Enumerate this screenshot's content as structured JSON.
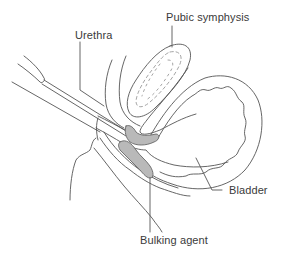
{
  "diagram": {
    "type": "anatomical-cross-section",
    "colors": {
      "line": "#555555",
      "dashed": "#9a9a9a",
      "bulking_fill": "#b9b9b9",
      "bulking_stroke": "#666666",
      "text": "#3a3a3a",
      "background": "#ffffff"
    },
    "labels": {
      "pubic_symphysis": "Pubic symphysis",
      "urethra": "Urethra",
      "bladder": "Bladder",
      "bulking_agent": "Bulking agent"
    }
  }
}
